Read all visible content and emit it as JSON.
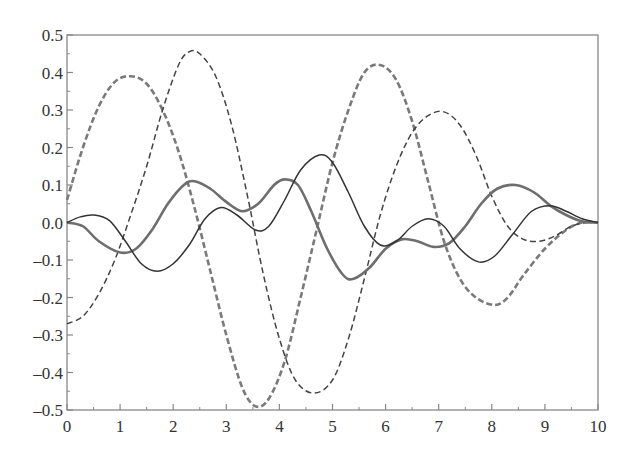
{
  "chart_data": {
    "type": "line",
    "title": "",
    "xlabel": "",
    "ylabel": "",
    "xlim": [
      0,
      10
    ],
    "ylim": [
      -0.5,
      0.5
    ],
    "grid": false,
    "legend": null,
    "x_ticks": [
      "0",
      "1",
      "2",
      "3",
      "4",
      "5",
      "6",
      "7",
      "8",
      "9",
      "10"
    ],
    "y_ticks": [
      "0.5",
      "0.4",
      "0.3",
      "0.2",
      "0.1",
      "0.0",
      "-0.1",
      "-0.2",
      "-0.3",
      "-0.4",
      "-0.5"
    ],
    "series": [
      {
        "name": "thick-dashed",
        "style": "dashed",
        "width": 2.6,
        "color": "#7a7a7a",
        "points": [
          [
            0,
            0.06
          ],
          [
            0.3,
            0.2
          ],
          [
            0.6,
            0.31
          ],
          [
            0.9,
            0.375
          ],
          [
            1.2,
            0.39
          ],
          [
            1.5,
            0.37
          ],
          [
            1.8,
            0.3
          ],
          [
            2.1,
            0.19
          ],
          [
            2.4,
            0.04
          ],
          [
            2.7,
            -0.13
          ],
          [
            3.0,
            -0.3
          ],
          [
            3.3,
            -0.44
          ],
          [
            3.55,
            -0.49
          ],
          [
            3.8,
            -0.47
          ],
          [
            4.1,
            -0.37
          ],
          [
            4.4,
            -0.2
          ],
          [
            4.7,
            -0.02
          ],
          [
            5.0,
            0.16
          ],
          [
            5.3,
            0.3
          ],
          [
            5.6,
            0.4
          ],
          [
            5.9,
            0.42
          ],
          [
            6.2,
            0.38
          ],
          [
            6.5,
            0.27
          ],
          [
            6.8,
            0.11
          ],
          [
            7.1,
            -0.05
          ],
          [
            7.4,
            -0.15
          ],
          [
            7.7,
            -0.2
          ],
          [
            8.05,
            -0.22
          ],
          [
            8.3,
            -0.2
          ],
          [
            8.6,
            -0.14
          ],
          [
            9.0,
            -0.07
          ],
          [
            9.4,
            -0.02
          ],
          [
            9.7,
            0.0
          ],
          [
            10,
            0.0
          ]
        ]
      },
      {
        "name": "thin-dashed",
        "style": "dashed",
        "width": 1.5,
        "color": "#444444",
        "points": [
          [
            0,
            -0.27
          ],
          [
            0.3,
            -0.25
          ],
          [
            0.6,
            -0.19
          ],
          [
            0.9,
            -0.1
          ],
          [
            1.2,
            0.02
          ],
          [
            1.5,
            0.15
          ],
          [
            1.8,
            0.3
          ],
          [
            2.1,
            0.42
          ],
          [
            2.3,
            0.455
          ],
          [
            2.5,
            0.45
          ],
          [
            2.8,
            0.39
          ],
          [
            3.1,
            0.26
          ],
          [
            3.4,
            0.07
          ],
          [
            3.7,
            -0.14
          ],
          [
            4.0,
            -0.31
          ],
          [
            4.3,
            -0.42
          ],
          [
            4.65,
            -0.455
          ],
          [
            5.0,
            -0.42
          ],
          [
            5.3,
            -0.31
          ],
          [
            5.6,
            -0.15
          ],
          [
            5.9,
            0.02
          ],
          [
            6.2,
            0.15
          ],
          [
            6.5,
            0.24
          ],
          [
            6.8,
            0.285
          ],
          [
            7.1,
            0.295
          ],
          [
            7.4,
            0.26
          ],
          [
            7.7,
            0.18
          ],
          [
            8.0,
            0.07
          ],
          [
            8.3,
            -0.01
          ],
          [
            8.6,
            -0.045
          ],
          [
            8.9,
            -0.05
          ],
          [
            9.2,
            -0.035
          ],
          [
            9.5,
            -0.01
          ],
          [
            9.8,
            0.0
          ],
          [
            10,
            0.0
          ]
        ]
      },
      {
        "name": "thick-solid",
        "style": "solid",
        "width": 2.6,
        "color": "#6e6e6e",
        "points": [
          [
            0,
            0.0
          ],
          [
            0.3,
            -0.01
          ],
          [
            0.6,
            -0.05
          ],
          [
            1.0,
            -0.08
          ],
          [
            1.3,
            -0.07
          ],
          [
            1.6,
            -0.02
          ],
          [
            1.9,
            0.05
          ],
          [
            2.2,
            0.1
          ],
          [
            2.4,
            0.11
          ],
          [
            2.7,
            0.09
          ],
          [
            3.0,
            0.055
          ],
          [
            3.3,
            0.03
          ],
          [
            3.6,
            0.05
          ],
          [
            3.9,
            0.1
          ],
          [
            4.1,
            0.115
          ],
          [
            4.35,
            0.1
          ],
          [
            4.6,
            0.03
          ],
          [
            4.9,
            -0.07
          ],
          [
            5.2,
            -0.14
          ],
          [
            5.4,
            -0.15
          ],
          [
            5.7,
            -0.12
          ],
          [
            6.0,
            -0.07
          ],
          [
            6.3,
            -0.045
          ],
          [
            6.6,
            -0.05
          ],
          [
            6.9,
            -0.065
          ],
          [
            7.2,
            -0.055
          ],
          [
            7.5,
            -0.01
          ],
          [
            7.8,
            0.05
          ],
          [
            8.1,
            0.09
          ],
          [
            8.45,
            0.1
          ],
          [
            8.8,
            0.08
          ],
          [
            9.1,
            0.045
          ],
          [
            9.4,
            0.02
          ],
          [
            9.7,
            0.003
          ],
          [
            10,
            0.0
          ]
        ]
      },
      {
        "name": "thin-solid",
        "style": "solid",
        "width": 1.5,
        "color": "#333333",
        "points": [
          [
            0,
            0.0
          ],
          [
            0.25,
            0.015
          ],
          [
            0.5,
            0.02
          ],
          [
            0.8,
            0.005
          ],
          [
            1.1,
            -0.05
          ],
          [
            1.4,
            -0.11
          ],
          [
            1.7,
            -0.13
          ],
          [
            2.0,
            -0.11
          ],
          [
            2.3,
            -0.06
          ],
          [
            2.6,
            0.01
          ],
          [
            2.9,
            0.04
          ],
          [
            3.2,
            0.02
          ],
          [
            3.55,
            -0.02
          ],
          [
            3.8,
            -0.01
          ],
          [
            4.1,
            0.06
          ],
          [
            4.4,
            0.14
          ],
          [
            4.75,
            0.18
          ],
          [
            5.0,
            0.16
          ],
          [
            5.3,
            0.08
          ],
          [
            5.6,
            -0.01
          ],
          [
            5.9,
            -0.06
          ],
          [
            6.2,
            -0.05
          ],
          [
            6.5,
            -0.01
          ],
          [
            6.8,
            0.01
          ],
          [
            7.1,
            -0.01
          ],
          [
            7.4,
            -0.07
          ],
          [
            7.75,
            -0.105
          ],
          [
            8.05,
            -0.09
          ],
          [
            8.4,
            -0.03
          ],
          [
            8.75,
            0.03
          ],
          [
            9.1,
            0.045
          ],
          [
            9.4,
            0.03
          ],
          [
            9.7,
            0.01
          ],
          [
            10,
            0.0
          ]
        ]
      }
    ]
  },
  "plot": {
    "box": {
      "left": 67,
      "top": 35,
      "right": 598,
      "bottom": 410
    },
    "axis_color": "#888888"
  }
}
